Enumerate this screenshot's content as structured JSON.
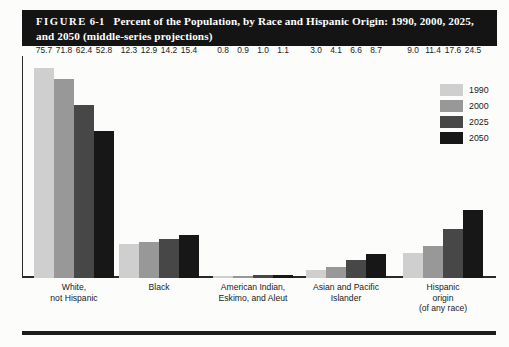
{
  "figure": {
    "label": "FIGURE",
    "number": "6-1",
    "title": "Percent of the Population, by Race and Hispanic Origin: 1990, 2000, 2025, and 2050 (middle-series projections)"
  },
  "legend": {
    "position": "top-right",
    "entries": [
      {
        "label": "1990",
        "color": "#cfcfcf"
      },
      {
        "label": "2000",
        "color": "#989898"
      },
      {
        "label": "2025",
        "color": "#474747"
      },
      {
        "label": "2050",
        "color": "#171717"
      }
    ]
  },
  "categories_display": [
    [
      "White,",
      "not Hispanic"
    ],
    [
      "Black"
    ],
    [
      "American Indian,",
      "Eskimo, and Aleut"
    ],
    [
      "Asian and Pacific",
      "Islander"
    ],
    [
      "Hispanic",
      "origin",
      "(of any race)"
    ]
  ],
  "chart_data": {
    "type": "bar",
    "title": "Percent of the Population, by Race and Hispanic Origin: 1990, 2000, 2025, and 2050 (middle-series projections)",
    "xlabel": "",
    "ylabel": "",
    "ylim": [
      0,
      80
    ],
    "grid": false,
    "legend_position": "top-right",
    "categories": [
      "White, not Hispanic",
      "Black",
      "American Indian, Eskimo, and Aleut",
      "Asian and Pacific Islander",
      "Hispanic origin (of any race)"
    ],
    "series": [
      {
        "name": "1990",
        "color": "#cfcfcf",
        "values": [
          75.7,
          12.3,
          0.8,
          3.0,
          9.0
        ]
      },
      {
        "name": "2000",
        "color": "#989898",
        "values": [
          71.8,
          12.9,
          0.9,
          4.1,
          11.4
        ]
      },
      {
        "name": "2025",
        "color": "#474747",
        "values": [
          62.4,
          14.2,
          1.0,
          6.6,
          17.6
        ]
      },
      {
        "name": "2050",
        "color": "#171717",
        "values": [
          52.8,
          15.4,
          1.1,
          8.7,
          24.5
        ]
      }
    ],
    "data_labels": [
      [
        "75.7",
        "71.8",
        "62.4",
        "52.8"
      ],
      [
        "12.3",
        "12.9",
        "14.2",
        "15.4"
      ],
      [
        "0.8",
        "0.9",
        "1.0",
        "1.1"
      ],
      [
        "3.0",
        "4.1",
        "6.6",
        "8.7"
      ],
      [
        "9.0",
        "11.4",
        "17.6",
        "24.5"
      ]
    ]
  }
}
